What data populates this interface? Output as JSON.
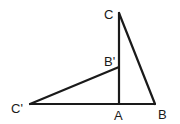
{
  "diagram": {
    "type": "geometry",
    "colors": {
      "stroke": "#1a1a1a",
      "background": "#ffffff"
    },
    "points": {
      "A": {
        "label": "A",
        "x": 119,
        "y": 104
      },
      "B": {
        "label": "B",
        "x": 155,
        "y": 104
      },
      "C": {
        "label": "C",
        "x": 119,
        "y": 13
      },
      "B_prime": {
        "label": "B'",
        "x": 119,
        "y": 67
      },
      "C_prime": {
        "label": "C'",
        "x": 30,
        "y": 104
      }
    },
    "segments": [
      [
        "C_prime",
        "B"
      ],
      [
        "A",
        "C"
      ],
      [
        "C",
        "B"
      ],
      [
        "C_prime",
        "B_prime"
      ]
    ]
  }
}
